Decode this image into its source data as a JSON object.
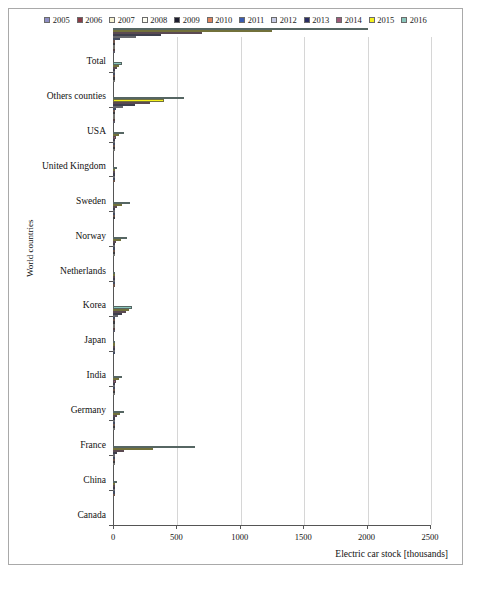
{
  "figure": {
    "yaxis_title": "World countries",
    "xaxis_title": "Electric car stock [thousands]"
  },
  "chart_data": {
    "type": "bar",
    "orientation": "horizontal",
    "title": "",
    "xlabel": "Electric car stock [thousands]",
    "ylabel": "World countries",
    "xlim": [
      0,
      2500
    ],
    "xticks": [
      0,
      500,
      1000,
      1500,
      2000,
      2500
    ],
    "grid": true,
    "legend_position": "top",
    "categories": [
      "Total",
      "Others counties",
      "USA",
      "United Kingdom",
      "Sweden",
      "Norway",
      "Netherlands",
      "Korea",
      "Japan",
      "India",
      "Germany",
      "France",
      "China",
      "Canada"
    ],
    "series": [
      {
        "name": "2005",
        "color": "#8e8ec4",
        "values": [
          1.9,
          0.0,
          1.1,
          0.0,
          0.0,
          0.0,
          0.0,
          0.0,
          0.7,
          0.0,
          0.0,
          0.0,
          0.0,
          0.0
        ]
      },
      {
        "name": "2006",
        "color": "#8a3b45",
        "values": [
          2.6,
          0.0,
          1.4,
          0.0,
          0.0,
          0.0,
          0.0,
          0.0,
          1.0,
          0.0,
          0.0,
          0.0,
          0.0,
          0.0
        ]
      },
      {
        "name": "2007",
        "color": "#f7f2d2",
        "values": [
          3.4,
          0.0,
          1.8,
          0.0,
          0.0,
          0.0,
          0.0,
          0.0,
          1.3,
          0.0,
          0.0,
          0.0,
          0.0,
          0.0
        ]
      },
      {
        "name": "2008",
        "color": "#fdfdf2",
        "values": [
          5.4,
          0.1,
          2.6,
          0.1,
          0.0,
          0.0,
          0.1,
          0.0,
          1.8,
          0.0,
          0.1,
          0.1,
          0.5,
          0.0
        ]
      },
      {
        "name": "2009",
        "color": "#1d1d2e",
        "values": [
          12.5,
          0.4,
          3.2,
          0.2,
          0.0,
          0.1,
          0.1,
          0.0,
          3.5,
          0.0,
          0.2,
          0.2,
          4.4,
          0.0
        ]
      },
      {
        "name": "2010",
        "color": "#e0845c",
        "values": [
          16.7,
          0.8,
          3.8,
          0.5,
          0.1,
          0.4,
          0.1,
          0.1,
          4.7,
          0.0,
          0.3,
          0.3,
          5.1,
          0.1
        ]
      },
      {
        "name": "2011",
        "color": "#3b5cb0",
        "values": [
          57.0,
          3.3,
          21.5,
          1.4,
          0.2,
          2.2,
          0.3,
          0.3,
          16.1,
          0.1,
          1.9,
          2.6,
          7.8,
          0.5
        ]
      },
      {
        "name": "2012",
        "color": "#c6cbe4",
        "values": [
          180.0,
          8.0,
          75.0,
          4.0,
          1.3,
          5.8,
          1.2,
          0.8,
          40.0,
          0.3,
          5.3,
          6.7,
          16.9,
          2.1
        ]
      },
      {
        "name": "2013",
        "color": "#2a2d63",
        "values": [
          381.0,
          16.0,
          172.0,
          9.3,
          3.2,
          12.2,
          5.5,
          1.8,
          69.5,
          0.7,
          12.4,
          16.9,
          32.2,
          5.7
        ]
      },
      {
        "name": "2014",
        "color": "#9d5a78",
        "values": [
          704.0,
          28.0,
          290.0,
          21.5,
          8.5,
          30.0,
          22.5,
          2.8,
          101.7,
          1.4,
          24.9,
          31.5,
          83.2,
          10.7
        ]
      },
      {
        "name": "2015",
        "color": "#f5f11d",
        "values": [
          1257.0,
          46.0,
          404.0,
          49.7,
          18.0,
          69.2,
          65.1,
          4.3,
          126.4,
          3.0,
          49.2,
          54.2,
          312.3,
          18.4
        ]
      },
      {
        "name": "2016",
        "color": "#89c6bb",
        "values": [
          2014.0,
          72.0,
          563.7,
          86.4,
          29.3,
          133.3,
          112.0,
          11.2,
          151.3,
          4.8,
          72.7,
          84.0,
          648.8,
          29.3
        ]
      }
    ]
  }
}
